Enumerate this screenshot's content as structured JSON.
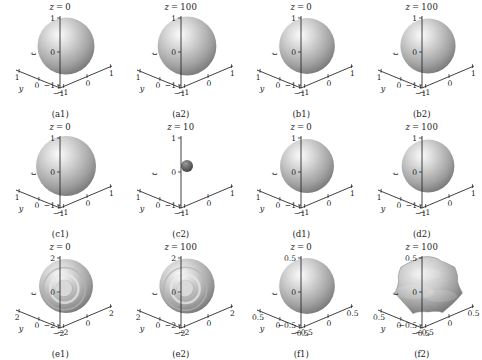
{
  "figure": {
    "name": "isosurface-grid",
    "rows": 3,
    "cols": 4,
    "vertical_axis_label": "t",
    "x_axis_label": "x",
    "y_axis_label": "y"
  },
  "chart_data": {
    "type": "scatter",
    "title": "",
    "xlabel": "x",
    "ylabel": "y",
    "zlabel": "t",
    "layout": "3x4 grid of 3D isosurface panels",
    "grid": false,
    "legend": null,
    "panels": [
      {
        "caption": "(a1)",
        "title_var": "z",
        "title_value": "0",
        "title": "z = 0",
        "xlim": [
          -1,
          1
        ],
        "ylim": [
          -1,
          1
        ],
        "tlim": [
          -1,
          1
        ],
        "xticks": [
          "-1",
          "0",
          "1"
        ],
        "yticks": [
          "1",
          "0",
          "-1"
        ],
        "tticks": [
          "1",
          "0",
          "-1"
        ],
        "shape": "sphere",
        "radius_rel": 0.95,
        "surface": "smooth"
      },
      {
        "caption": "(a2)",
        "title_var": "z",
        "title_value": "100",
        "title": "z = 100",
        "xlim": [
          -1,
          1
        ],
        "ylim": [
          -1,
          1
        ],
        "tlim": [
          -1,
          1
        ],
        "xticks": [
          "-1",
          "0",
          "1"
        ],
        "yticks": [
          "1",
          "0",
          "-1"
        ],
        "tticks": [
          "1",
          "0",
          "-1"
        ],
        "shape": "sphere",
        "radius_rel": 0.98,
        "surface": "smooth"
      },
      {
        "caption": "(b1)",
        "title_var": "z",
        "title_value": "0",
        "title": "z = 0",
        "xlim": [
          -1,
          1
        ],
        "ylim": [
          -1,
          1
        ],
        "tlim": [
          -1,
          1
        ],
        "xticks": [
          "-1",
          "0",
          "1"
        ],
        "yticks": [
          "1",
          "0",
          "-1"
        ],
        "tticks": [
          "1",
          "0",
          "-1"
        ],
        "shape": "sphere",
        "radius_rel": 0.93,
        "surface": "smooth"
      },
      {
        "caption": "(b2)",
        "title_var": "z",
        "title_value": "100",
        "title": "z = 100",
        "xlim": [
          -1,
          1
        ],
        "ylim": [
          -1,
          1
        ],
        "tlim": [
          -1,
          1
        ],
        "xticks": [
          "-1",
          "0",
          "1"
        ],
        "yticks": [
          "1",
          "0",
          "-1"
        ],
        "tticks": [
          "1",
          "0",
          "-1"
        ],
        "shape": "sphere",
        "radius_rel": 0.92,
        "surface": "smooth"
      },
      {
        "caption": "(c1)",
        "title_var": "z",
        "title_value": "0",
        "title": "z = 0",
        "xlim": [
          -1,
          1
        ],
        "ylim": [
          -1,
          1
        ],
        "tlim": [
          -1,
          1
        ],
        "xticks": [
          "-1",
          "0",
          "1"
        ],
        "yticks": [
          "1",
          "0",
          "-1"
        ],
        "tticks": [
          "1",
          "0",
          "-1"
        ],
        "shape": "sphere",
        "radius_rel": 1.0,
        "surface": "smooth"
      },
      {
        "caption": "(c2)",
        "title_var": "z",
        "title_value": "10",
        "title": "z = 10",
        "xlim": [
          -1,
          1
        ],
        "ylim": [
          -1,
          1
        ],
        "tlim": [
          -1,
          1
        ],
        "xticks": [
          "-1",
          "0",
          "1"
        ],
        "yticks": [
          "1",
          "0",
          "-1"
        ],
        "tticks": [
          "1",
          "0",
          "-1"
        ],
        "shape": "sphere",
        "radius_rel": 0.2,
        "surface": "smooth"
      },
      {
        "caption": "(d1)",
        "title_var": "z",
        "title_value": "0",
        "title": "z = 0",
        "xlim": [
          -1,
          1
        ],
        "ylim": [
          -1,
          1
        ],
        "tlim": [
          -1,
          1
        ],
        "xticks": [
          "-1",
          "0",
          "1"
        ],
        "yticks": [
          "1",
          "0",
          "-1"
        ],
        "tticks": [
          "1",
          "0",
          "-1"
        ],
        "shape": "sphere",
        "radius_rel": 0.9,
        "surface": "smooth"
      },
      {
        "caption": "(d2)",
        "title_var": "z",
        "title_value": "100",
        "title": "z = 100",
        "xlim": [
          -1,
          1
        ],
        "ylim": [
          -1,
          1
        ],
        "tlim": [
          -1,
          1
        ],
        "xticks": [
          "-1",
          "0",
          "1"
        ],
        "yticks": [
          "1",
          "0",
          "-1"
        ],
        "tticks": [
          "1",
          "0",
          "-1"
        ],
        "shape": "sphere",
        "radius_rel": 0.88,
        "surface": "smooth"
      },
      {
        "caption": "(e1)",
        "title_var": "z",
        "title_value": "0",
        "title": "z = 0",
        "xlim": [
          -2,
          2
        ],
        "ylim": [
          -2,
          2
        ],
        "tlim": [
          -2,
          2
        ],
        "xticks": [
          "-2",
          "0",
          "2"
        ],
        "yticks": [
          "2",
          "0",
          "-2"
        ],
        "tticks": [
          "2",
          "0",
          "-2"
        ],
        "shape": "sphere-rings",
        "radius_rel": 0.9,
        "surface": "concentric-rings"
      },
      {
        "caption": "(e2)",
        "title_var": "z",
        "title_value": "100",
        "title": "z = 100",
        "xlim": [
          -2,
          2
        ],
        "ylim": [
          -2,
          2
        ],
        "tlim": [
          -2,
          2
        ],
        "xticks": [
          "-2",
          "0",
          "2"
        ],
        "yticks": [
          "2",
          "0",
          "-2"
        ],
        "tticks": [
          "2",
          "0",
          "-2"
        ],
        "shape": "sphere-rings",
        "radius_rel": 0.92,
        "surface": "concentric-rings"
      },
      {
        "caption": "(f1)",
        "title_var": "z",
        "title_value": "0",
        "title": "z = 0",
        "xlim": [
          -0.5,
          0.5
        ],
        "ylim": [
          -0.5,
          0.5
        ],
        "tlim": [
          -0.5,
          0.5
        ],
        "xticks": [
          "-0.5",
          "0",
          "0.5"
        ],
        "yticks": [
          "0.5",
          "0",
          "-0.5"
        ],
        "tticks": [
          "0.5",
          "0",
          "-0.5"
        ],
        "shape": "sphere",
        "radius_rel": 0.93,
        "surface": "smooth"
      },
      {
        "caption": "(f2)",
        "title_var": "z",
        "title_value": "100",
        "title": "z = 100",
        "xlim": [
          -0.5,
          0.5
        ],
        "ylim": [
          -0.5,
          0.5
        ],
        "tlim": [
          -0.5,
          0.5
        ],
        "xticks": [
          "-0.5",
          "0",
          "0.5"
        ],
        "yticks": [
          "0.5",
          "0",
          "-0.5"
        ],
        "tticks": [
          "0.5",
          "0",
          "-0.5"
        ],
        "shape": "lumpy-blob",
        "radius_rel": 1.0,
        "surface": "bumpy-faceted"
      }
    ]
  }
}
